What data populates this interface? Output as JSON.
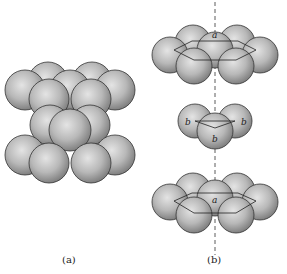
{
  "figure": {
    "panel_a": {
      "caption": "(a)"
    },
    "panel_b": {
      "caption": "(b)",
      "top_layer": {
        "label": "a"
      },
      "middle_layer": {
        "labels": [
          "b",
          "b",
          "b"
        ]
      },
      "bottom_layer": {
        "label": "a"
      }
    }
  }
}
